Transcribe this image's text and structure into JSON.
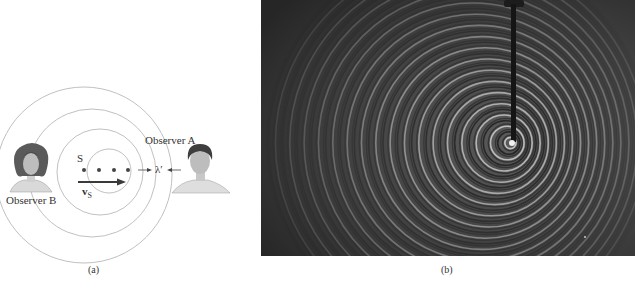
{
  "figure": {
    "panel_a": {
      "caption": "(a)",
      "source_label": "S",
      "velocity_label": "v",
      "velocity_subscript": "S",
      "wavelength_label": "λ′",
      "observer_a_label": "Observer A",
      "observer_b_label": "Observer B",
      "source_positions_count": 4,
      "wavefront_count": 4
    },
    "panel_b": {
      "caption": "(b)",
      "description": "Ripple tank photograph of circular wavefronts from a moving vibrating source"
    },
    "colors": {
      "wavefront": "#a8a8a8",
      "arrow": "#404040",
      "photo_background": "#3a3a3a",
      "ring_light": "#d8d8d8",
      "ring_dark": "#1a1a1a"
    }
  }
}
